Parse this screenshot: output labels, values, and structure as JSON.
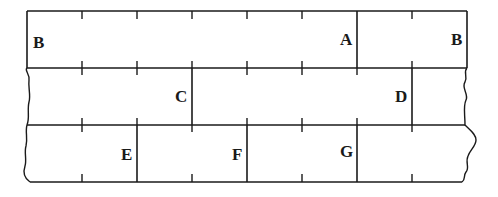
{
  "diagram": {
    "colors": {
      "line": "#1a1a1a",
      "background": "#ffffff"
    },
    "rows": [
      {
        "index": 1,
        "labels": [
          "B",
          "A",
          "B"
        ]
      },
      {
        "index": 2,
        "labels": [
          "C",
          "D"
        ]
      },
      {
        "index": 3,
        "labels": [
          "E",
          "F",
          "G"
        ]
      }
    ],
    "labels": {
      "b_left": "B",
      "a": "A",
      "b_right": "B",
      "c": "C",
      "d": "D",
      "e": "E",
      "f": "F",
      "g": "G"
    }
  }
}
